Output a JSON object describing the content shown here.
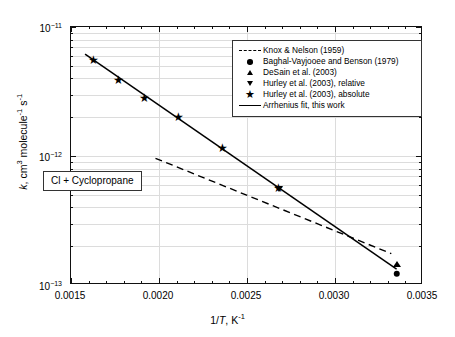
{
  "chart_data": {
    "type": "scatter",
    "title": "",
    "annotation": "Cl + Cyclopropane",
    "xlabel": "1/T, K-1",
    "ylabel": "k, cm3 molecule-1 s-1",
    "xlim": [
      0.0015,
      0.0035
    ],
    "ylim": [
      1e-13,
      1e-11
    ],
    "yscale": "log",
    "xscale": "linear",
    "grid": true,
    "legend_position": "top-right",
    "xticks": [
      "0.0015",
      "0.0020",
      "0.0025",
      "0.0030",
      "0.0035"
    ],
    "xtick_values": [
      0.0015,
      0.002,
      0.0025,
      0.003,
      0.0035
    ],
    "ytick_labels": [
      "10-13",
      "10-12",
      "10-11"
    ],
    "ytick_values": [
      1e-13,
      1e-12,
      1e-11
    ],
    "series": [
      {
        "name": "Knox & Nelson (1959)",
        "marker": "dashed-line",
        "type": "line",
        "style": "dashed",
        "x": [
          0.00198,
          0.00332
        ],
        "y": [
          9.6e-13,
          1.75e-13
        ]
      },
      {
        "name": "Baghal-Vayjooee and Benson (1979)",
        "marker": "circle",
        "type": "point",
        "x": [
          0.00335
        ],
        "y": [
          1.22e-13
        ]
      },
      {
        "name": "DeSain et al. (2003)",
        "marker": "triangle-up",
        "type": "point",
        "x": [
          0.00335
        ],
        "y": [
          1.45e-13
        ]
      },
      {
        "name": "Hurley et al. (2003), relative",
        "marker": "triangle-down",
        "type": "point",
        "x": [
          0.00268
        ],
        "y": [
          5.5e-13
        ]
      },
      {
        "name": "Hurley et al. (2003), absolute",
        "marker": "star",
        "type": "point",
        "x": [
          0.00163,
          0.00177,
          0.00192,
          0.00211,
          0.00236,
          0.00268
        ],
        "y": [
          5.5e-12,
          3.85e-12,
          2.8e-12,
          2e-12,
          1.15e-12,
          5.6e-13
        ]
      },
      {
        "name": "Arrhenius fit, this work",
        "marker": "solid-line",
        "type": "line",
        "style": "solid",
        "x": [
          0.00158,
          0.00335
        ],
        "y": [
          6.15e-12,
          1.33e-13
        ]
      }
    ]
  },
  "legend": {
    "items": [
      {
        "label": "Knox & Nelson (1959)",
        "key": "dashed-line-key"
      },
      {
        "label": "Baghal-Vayjooee and Benson (1979)",
        "key": "circle-key"
      },
      {
        "label": "DeSain et al. (2003)",
        "key": "triangle-up-key"
      },
      {
        "label": "Hurley et al. (2003), relative",
        "key": "triangle-down-key"
      },
      {
        "label": "Hurley et al. (2003), absolute",
        "key": "star-key"
      },
      {
        "label": "Arrhenius fit, this work",
        "key": "solid-line-key"
      }
    ]
  },
  "axes": {
    "x_title_main": "1/",
    "x_title_italic": "T",
    "x_title_rest": ", K",
    "x_title_sup": "-1",
    "y_title_italic": "k",
    "y_title_part1": ", cm",
    "y_title_sup1": "3",
    "y_title_part2": " molecule",
    "y_title_sup2": "-1",
    "y_title_part3": " s",
    "y_title_sup3": "-1"
  },
  "annotation": {
    "text": "Cl + Cyclopropane"
  },
  "ytick_labels": [
    {
      "mantissa": "10",
      "exp": "-11"
    },
    {
      "mantissa": "10",
      "exp": "-12"
    },
    {
      "mantissa": "10",
      "exp": "-13"
    }
  ],
  "xtick_labels": [
    "0.0015",
    "0.0020",
    "0.0025",
    "0.0030",
    "0.0035"
  ],
  "colors": {
    "axis": "#111111",
    "grid": "#dcdcdc",
    "marker": "#000000",
    "background": "#ffffff"
  }
}
